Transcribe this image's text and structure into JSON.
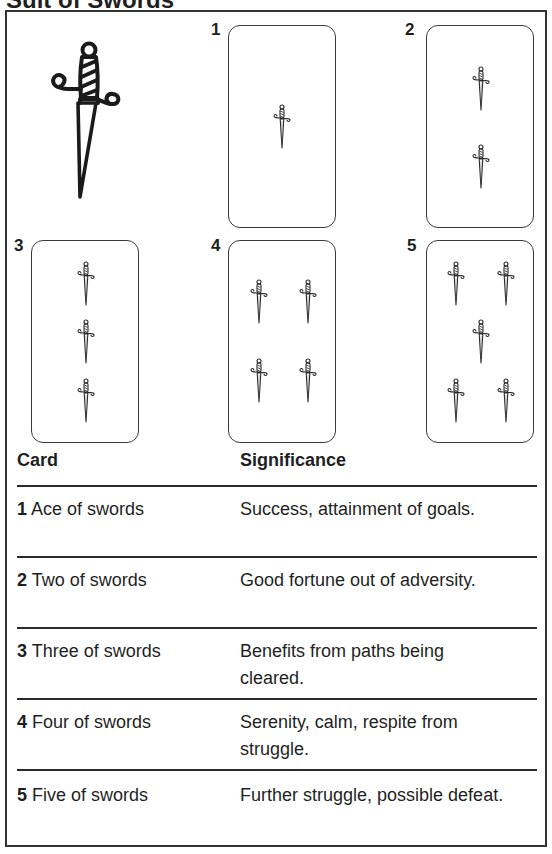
{
  "title": "Suit of Swords",
  "icons": {
    "main": "sword-icon",
    "pip": "small-sword-icon"
  },
  "colors": {
    "ink": "#1f1f1f",
    "card_border": "#3a3a3a",
    "background": "#ffffff"
  },
  "cards": [
    {
      "number": "1",
      "pips": 1
    },
    {
      "number": "2",
      "pips": 2
    },
    {
      "number": "3",
      "pips": 3
    },
    {
      "number": "4",
      "pips": 4
    },
    {
      "number": "5",
      "pips": 5
    }
  ],
  "table": {
    "headers": {
      "card": "Card",
      "significance": "Significance"
    },
    "rows": [
      {
        "num": "1",
        "name": "Ace of swords",
        "significance": "Success, attainment of goals."
      },
      {
        "num": "2",
        "name": "Two of swords",
        "significance": "Good fortune out of adversity."
      },
      {
        "num": "3",
        "name": "Three of swords",
        "significance": "Benefits from paths being cleared."
      },
      {
        "num": "4",
        "name": "Four of swords",
        "significance": "Serenity, calm, respite from struggle."
      },
      {
        "num": "5",
        "name": "Five of swords",
        "significance": "Further struggle, possible defeat."
      }
    ]
  }
}
